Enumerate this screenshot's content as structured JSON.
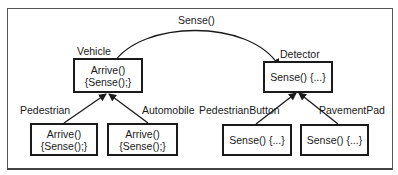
{
  "diagram": {
    "message": {
      "label": "Sense()",
      "from": "Vehicle",
      "to": "Detector"
    },
    "classes": {
      "vehicle": {
        "name": "Vehicle",
        "line1": "Arrive()",
        "line2": "{Sense();}"
      },
      "pedestrian": {
        "name": "Pedestrian",
        "line1": "Arrive()",
        "line2": "{Sense();}",
        "parent": "Vehicle"
      },
      "automobile": {
        "name": "Automobile",
        "line1": "Arrive()",
        "line2": "{Sense();}",
        "parent": "Vehicle"
      },
      "detector": {
        "name": "Detector",
        "line1": "Sense() {...}"
      },
      "pedestrian_button": {
        "name": "PedestrianButton",
        "line1": "Sense() {...}",
        "parent": "Detector"
      },
      "pavement_pad": {
        "name": "PavementPad",
        "line1": "Sense() {...}",
        "parent": "Detector"
      }
    },
    "colors": {
      "line": "#1a1a1a",
      "frame": "#555555",
      "background": "#ffffff"
    }
  }
}
